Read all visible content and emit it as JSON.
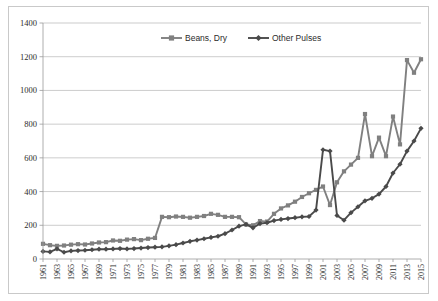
{
  "chart_data": {
    "type": "line",
    "title": "",
    "xlabel": "",
    "ylabel": "",
    "ylim": [
      0,
      1400
    ],
    "ytick_step": 200,
    "yticks": [
      "0",
      "200",
      "400",
      "600",
      "800",
      "1000",
      "1200",
      "1400"
    ],
    "grid": true,
    "legend_position": "top-center",
    "x": [
      1961,
      1962,
      1963,
      1964,
      1965,
      1966,
      1967,
      1968,
      1969,
      1970,
      1971,
      1972,
      1973,
      1974,
      1975,
      1976,
      1977,
      1978,
      1979,
      1980,
      1981,
      1982,
      1983,
      1984,
      1985,
      1986,
      1987,
      1988,
      1989,
      1990,
      1991,
      1992,
      1993,
      1994,
      1995,
      1996,
      1997,
      1998,
      1999,
      2000,
      2001,
      2002,
      2003,
      2004,
      2005,
      2006,
      2007,
      2008,
      2009,
      2010,
      2011,
      2012,
      2013,
      2014,
      2015
    ],
    "xtick_labels": [
      "1961",
      "1963",
      "1965",
      "1967",
      "1969",
      "1971",
      "1973",
      "1975",
      "1977",
      "1979",
      "1981",
      "1983",
      "1985",
      "1987",
      "1989",
      "1991",
      "1993",
      "1995",
      "1997",
      "1999",
      "2001",
      "2003",
      "2005",
      "2007",
      "2009",
      "2011",
      "2013",
      "2015"
    ],
    "series": [
      {
        "name": "Beans, Dry",
        "color": "#808080",
        "marker": "square",
        "values": [
          90,
          82,
          78,
          80,
          85,
          88,
          86,
          92,
          98,
          100,
          110,
          108,
          115,
          118,
          112,
          120,
          125,
          250,
          248,
          252,
          250,
          245,
          250,
          255,
          268,
          262,
          250,
          250,
          248,
          205,
          200,
          225,
          222,
          268,
          300,
          318,
          340,
          368,
          390,
          410,
          430,
          320,
          455,
          520,
          560,
          600,
          860,
          610,
          720,
          610,
          845,
          680,
          1180,
          1105,
          1185
        ]
      },
      {
        "name": "Other Pulses",
        "color": "#4a4a4a",
        "marker": "diamond",
        "values": [
          45,
          42,
          60,
          40,
          48,
          50,
          52,
          55,
          58,
          58,
          60,
          62,
          60,
          62,
          65,
          68,
          70,
          72,
          78,
          85,
          95,
          105,
          112,
          120,
          128,
          135,
          150,
          172,
          195,
          205,
          185,
          210,
          215,
          228,
          235,
          240,
          245,
          250,
          252,
          290,
          648,
          640,
          258,
          230,
          275,
          310,
          345,
          360,
          385,
          430,
          510,
          562,
          640,
          700,
          775
        ]
      }
    ]
  }
}
